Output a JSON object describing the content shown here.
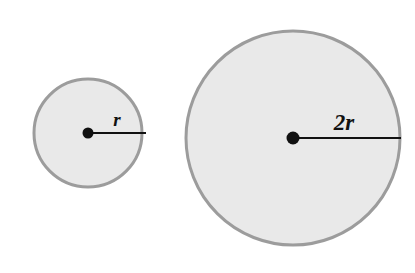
{
  "figure": {
    "background_color": "#ffffff",
    "width": 415,
    "height": 273,
    "style": {
      "fill_color": "#e9e9e9",
      "stroke_color": "#9c9c9c",
      "stroke_width": 3,
      "line_color": "#111111",
      "line_width": 2,
      "dot_color": "#111111",
      "label_color": "#111111"
    },
    "shapes": [
      {
        "name": "small-circle",
        "label": "r",
        "cx": 88,
        "cy": 133,
        "r": 54,
        "dot_r": 5.5,
        "radius_line": {
          "x1": 88,
          "y1": 133,
          "x2": 146,
          "y2": 133
        },
        "label_x": 117,
        "label_y": 126
      },
      {
        "name": "large-circle",
        "label": "2r",
        "cx": 293,
        "cy": 138,
        "r": 107,
        "dot_r": 6.5,
        "radius_line": {
          "x1": 293,
          "y1": 138,
          "x2": 401,
          "y2": 138
        },
        "label_x": 344,
        "label_y": 130
      }
    ]
  }
}
